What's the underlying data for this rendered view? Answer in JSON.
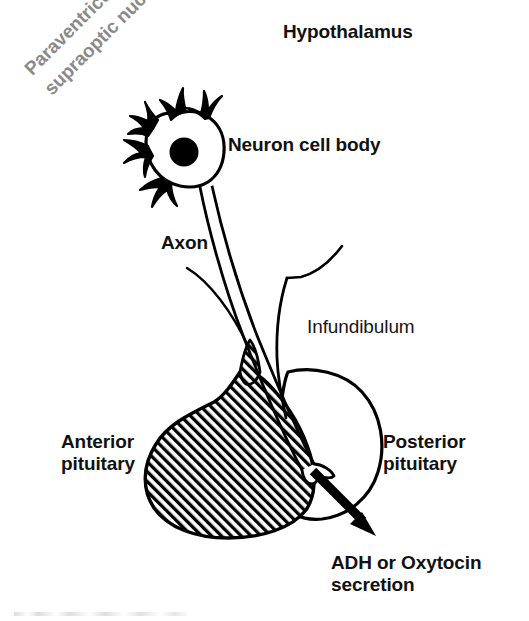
{
  "figure": {
    "background_color": "#ffffff",
    "ink_color": "#000000",
    "muted_label_color": "#8a8a8a",
    "width": 529,
    "height": 621
  },
  "labels": {
    "hypothalamus": "Hypothalamus",
    "nuclei": "Paraventricular and\nsupraoptic nuclei",
    "neuron_cell_body": "Neuron cell body",
    "axon": "Axon",
    "infundibulum": "Infundibulum",
    "anterior_pituitary": "Anterior\npituitary",
    "posterior_pituitary": "Posterior\npituitary",
    "secretion": "ADH or Oxytocin\nsecretion"
  },
  "structures": {
    "neuron_soma": "neuron cell body with dendrites and dark nucleus",
    "neuron_nucleus": "filled black nucleus",
    "dendrites_count": 5,
    "axon": "long double-lined axon running from soma to posterior pituitary",
    "infundibulum": "pituitary stalk outline",
    "anterior_pituitary": "diagonally hatched lobe",
    "posterior_pituitary": "unshaded outlined lobe",
    "secretion_arrow": "thick arrow pointing down-right out of posterior pituitary"
  }
}
